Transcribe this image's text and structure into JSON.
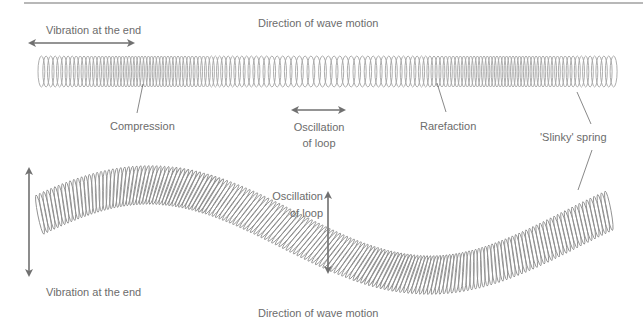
{
  "diagram": {
    "colors": {
      "spring": "#9a9a9a",
      "arrow": "#707070",
      "text": "#6c6c6c",
      "rule": "#b8b8b8"
    },
    "longitudinal": {
      "vibration_label": "Vibration at the end",
      "direction_label": "Direction of wave motion",
      "compression_label": "Compression",
      "oscillation_label_line1": "Oscillation",
      "oscillation_label_line2": "of loop",
      "rarefaction_label": "Rarefaction",
      "slinky_label": "'Slinky' spring"
    },
    "transverse": {
      "oscillation_label_line1": "Oscillation",
      "oscillation_label_line2": "of loop",
      "vibration_label": "Vibration at the end",
      "direction_label": "Direction of wave motion"
    }
  }
}
